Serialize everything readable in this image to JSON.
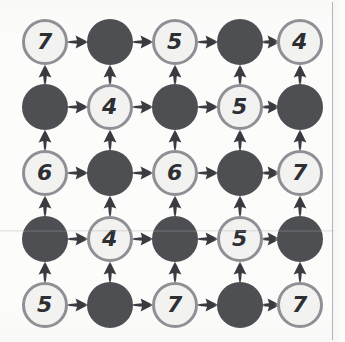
{
  "figure": {
    "type": "directed-grid-graph",
    "rows": 5,
    "cols": 5,
    "colors": {
      "background": "#fcfcfb",
      "light_node_fill": "#f2f2f0",
      "light_node_ring": "#8e9095",
      "dark_node_fill": "#4e4f53",
      "label_text": "#2e2f33",
      "arrow": "#3a3b40",
      "edge_rule": "#787a80"
    },
    "geometry": {
      "col_centers": [
        45,
        110,
        175,
        240,
        300
      ],
      "row_centers": [
        42,
        107,
        173,
        239,
        305
      ],
      "node_diameter": 46
    }
  },
  "nodes": [
    [
      {
        "kind": "light",
        "label": "7",
        "name": "node-r1c1"
      },
      {
        "kind": "dark",
        "label": "",
        "name": "node-r1c2"
      },
      {
        "kind": "light",
        "label": "5",
        "name": "node-r1c3"
      },
      {
        "kind": "dark",
        "label": "",
        "name": "node-r1c4"
      },
      {
        "kind": "light",
        "label": "4",
        "name": "node-r1c5"
      }
    ],
    [
      {
        "kind": "dark",
        "label": "",
        "name": "node-r2c1"
      },
      {
        "kind": "light",
        "label": "4",
        "name": "node-r2c2"
      },
      {
        "kind": "dark",
        "label": "",
        "name": "node-r2c3"
      },
      {
        "kind": "light",
        "label": "5",
        "name": "node-r2c4"
      },
      {
        "kind": "dark",
        "label": "",
        "name": "node-r2c5"
      }
    ],
    [
      {
        "kind": "light",
        "label": "6",
        "name": "node-r3c1"
      },
      {
        "kind": "dark",
        "label": "",
        "name": "node-r3c2"
      },
      {
        "kind": "light",
        "label": "6",
        "name": "node-r3c3"
      },
      {
        "kind": "dark",
        "label": "",
        "name": "node-r3c4"
      },
      {
        "kind": "light",
        "label": "7",
        "name": "node-r3c5"
      }
    ],
    [
      {
        "kind": "dark",
        "label": "",
        "name": "node-r4c1"
      },
      {
        "kind": "light",
        "label": "4",
        "name": "node-r4c2"
      },
      {
        "kind": "dark",
        "label": "",
        "name": "node-r4c3"
      },
      {
        "kind": "light",
        "label": "5",
        "name": "node-r4c4"
      },
      {
        "kind": "dark",
        "label": "",
        "name": "node-r4c5"
      }
    ],
    [
      {
        "kind": "light",
        "label": "5",
        "name": "node-r5c1"
      },
      {
        "kind": "dark",
        "label": "",
        "name": "node-r5c2"
      },
      {
        "kind": "light",
        "label": "7",
        "name": "node-r5c3"
      },
      {
        "kind": "dark",
        "label": "",
        "name": "node-r5c4"
      },
      {
        "kind": "light",
        "label": "7",
        "name": "node-r5c5"
      }
    ]
  ],
  "arrows": {
    "horizontal_direction": "right",
    "vertical_direction": "up",
    "horizontal_icon": "arrow-right-icon",
    "vertical_icon": "arrow-up-icon"
  }
}
